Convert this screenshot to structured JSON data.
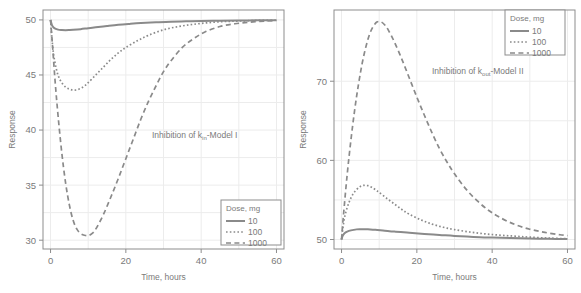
{
  "figure": {
    "background": "#ffffff",
    "line_color": "#8a8a8a",
    "grid_color": "#ececec",
    "axis_color": "#8d8d8d",
    "text_color": "#7a7a7a"
  },
  "chart_data": [
    {
      "type": "line",
      "panel": "left",
      "title": "",
      "annotation": "Inhibition of k",
      "annotation_sub": "in",
      "annotation_tail": "-Model I",
      "xlabel": "Time, hours",
      "ylabel": "Response",
      "xlim": [
        -2,
        62
      ],
      "ylim": [
        29.2,
        50.9
      ],
      "xticks": [
        0,
        20,
        40,
        60
      ],
      "yticks": [
        30,
        35,
        40,
        45,
        50
      ],
      "xtick_labels": [
        "0",
        "20",
        "40",
        "60"
      ],
      "ytick_labels": [
        "30",
        "35",
        "40",
        "45",
        "50"
      ],
      "grid": true,
      "legend_position": "bottom-right",
      "legend_title": "Dose, mg",
      "series": [
        {
          "name": "10",
          "dash": "solid",
          "x": [
            0,
            0.4,
            1,
            2,
            3,
            4,
            5,
            6,
            8,
            10,
            12,
            15,
            18,
            21,
            24,
            28,
            32,
            36,
            40,
            45,
            50,
            55,
            60
          ],
          "values": [
            50.0,
            49.5,
            49.25,
            49.12,
            49.08,
            49.07,
            49.08,
            49.1,
            49.16,
            49.25,
            49.33,
            49.45,
            49.56,
            49.64,
            49.71,
            49.78,
            49.84,
            49.87,
            49.9,
            49.93,
            49.95,
            49.96,
            49.97
          ]
        },
        {
          "name": "100",
          "dash": "dotted",
          "x": [
            0,
            0.3,
            0.8,
            1.5,
            2.2,
            3,
            4,
            5,
            6,
            7,
            8,
            9,
            10,
            12,
            14,
            16,
            18,
            20,
            23,
            26,
            30,
            34,
            38,
            42,
            46,
            50,
            55,
            60
          ],
          "values": [
            50.0,
            48.6,
            46.9,
            45.6,
            44.8,
            44.3,
            43.9,
            43.72,
            43.63,
            43.65,
            43.78,
            44.0,
            44.3,
            45.0,
            45.7,
            46.4,
            47.0,
            47.5,
            48.1,
            48.6,
            49.1,
            49.4,
            49.6,
            49.75,
            49.85,
            49.9,
            49.95,
            49.97
          ]
        },
        {
          "name": "1000",
          "dash": "dashed",
          "x": [
            0,
            0.5,
            1.2,
            2,
            3,
            4,
            5,
            6,
            7,
            8,
            9,
            10,
            11,
            12,
            14,
            16,
            18,
            20,
            22,
            24,
            26,
            28,
            30,
            32,
            35,
            38,
            41,
            45,
            49,
            53,
            57,
            60
          ],
          "values": [
            50.0,
            47.8,
            44.5,
            41.3,
            37.9,
            35.2,
            33.2,
            31.8,
            31.0,
            30.6,
            30.45,
            30.42,
            30.6,
            31.0,
            32.3,
            33.9,
            35.6,
            37.4,
            39.2,
            41.0,
            42.6,
            44.0,
            45.3,
            46.3,
            47.5,
            48.3,
            48.9,
            49.4,
            49.65,
            49.8,
            49.9,
            49.95
          ]
        }
      ]
    },
    {
      "type": "line",
      "panel": "right",
      "title": "",
      "annotation": "Inhibition of k",
      "annotation_sub": "out",
      "annotation_tail": "-Model II",
      "xlabel": "Time, hours",
      "ylabel": "Response",
      "xlim": [
        -2,
        62
      ],
      "ylim": [
        48.8,
        79.0
      ],
      "xticks": [
        0,
        20,
        40,
        60
      ],
      "yticks": [
        50,
        60,
        70
      ],
      "xtick_labels": [
        "0",
        "20",
        "40",
        "60"
      ],
      "ytick_labels": [
        "50",
        "60",
        "70"
      ],
      "grid": true,
      "legend_position": "top-right",
      "legend_title": "Dose, mg",
      "series": [
        {
          "name": "10",
          "dash": "solid",
          "x": [
            0,
            0.3,
            0.8,
            1.5,
            2.5,
            4,
            5,
            6,
            7,
            9,
            11,
            14,
            18,
            22,
            26,
            30,
            35,
            40,
            45,
            50,
            55,
            60
          ],
          "values": [
            50.0,
            50.45,
            50.8,
            51.0,
            51.15,
            51.28,
            51.3,
            51.3,
            51.28,
            51.22,
            51.15,
            51.0,
            50.85,
            50.7,
            50.58,
            50.45,
            50.33,
            50.25,
            50.18,
            50.12,
            50.08,
            50.05
          ]
        },
        {
          "name": "100",
          "dash": "dotted",
          "x": [
            0,
            0.4,
            1,
            2,
            3,
            4,
            5,
            6,
            7,
            8,
            9,
            10,
            12,
            14,
            16,
            18,
            21,
            24,
            27,
            30,
            34,
            38,
            42,
            46,
            50,
            55,
            60
          ],
          "values": [
            50.0,
            51.6,
            53.2,
            54.7,
            55.7,
            56.3,
            56.7,
            56.85,
            56.8,
            56.6,
            56.3,
            55.95,
            55.2,
            54.5,
            53.8,
            53.2,
            52.5,
            51.95,
            51.55,
            51.25,
            50.95,
            50.72,
            50.55,
            50.42,
            50.3,
            50.18,
            50.1
          ]
        },
        {
          "name": "1000",
          "dash": "dashed",
          "x": [
            0,
            0.5,
            1.5,
            2.5,
            3.5,
            4.5,
            5.5,
            6.5,
            7.5,
            8.5,
            9.5,
            10.5,
            11.5,
            12.5,
            14,
            16,
            18,
            20,
            22,
            24,
            26,
            28,
            30,
            33,
            36,
            39,
            42,
            46,
            50,
            54,
            58,
            60
          ],
          "values": [
            50.0,
            53.0,
            58.2,
            62.6,
            66.4,
            69.6,
            72.3,
            74.4,
            76.0,
            77.0,
            77.5,
            77.5,
            77.1,
            76.4,
            75.0,
            72.8,
            70.4,
            68.0,
            65.7,
            63.5,
            61.5,
            59.8,
            58.3,
            56.4,
            54.9,
            53.7,
            52.8,
            51.9,
            51.3,
            50.9,
            50.6,
            50.5
          ]
        }
      ]
    }
  ]
}
